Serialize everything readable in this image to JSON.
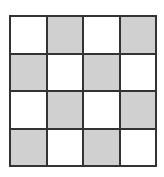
{
  "grid": {
    "rows": 4,
    "cols": 4,
    "shaded_color": "#d0d0d0",
    "empty_color": "#ffffff",
    "border_color": "#333333",
    "cells": [
      [
        0,
        1,
        0,
        1
      ],
      [
        1,
        0,
        1,
        0
      ],
      [
        0,
        1,
        0,
        1
      ],
      [
        1,
        0,
        1,
        0
      ]
    ]
  }
}
